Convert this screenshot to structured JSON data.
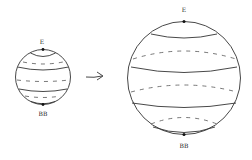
{
  "diagram": {
    "small_sphere": {
      "top_label": "E",
      "bottom_label": "BB"
    },
    "arrow": {
      "direction": "right",
      "glyph": "→"
    },
    "large_sphere": {
      "top_label": "E",
      "bottom_label": "BB"
    },
    "colors": {
      "line": "#333333",
      "background": "#ffffff"
    }
  }
}
